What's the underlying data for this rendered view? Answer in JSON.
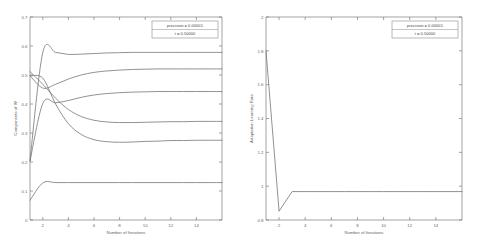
{
  "figure": {
    "background": "#ffffff",
    "line_color": "#6e6e6e",
    "axis_color": "#7d7d7d"
  },
  "chart_data": [
    {
      "type": "line",
      "panel": "left",
      "title": "",
      "xlabel": "Number of Iterations",
      "ylabel": "Components of W",
      "xlim": [
        1,
        16
      ],
      "ylim": [
        0,
        0.7
      ],
      "xticks": [
        2,
        4,
        6,
        8,
        10,
        12,
        14
      ],
      "yticks": [
        0,
        0.1,
        0.2,
        0.3,
        0.4,
        0.5,
        0.6,
        0.7
      ],
      "grid": false,
      "legend_position": "upper right",
      "legend": [
        "precision = 0.00001",
        "t = 0.50000"
      ],
      "x": [
        1,
        2,
        3,
        4,
        5,
        6,
        7,
        8,
        9,
        10,
        11,
        12,
        13,
        14,
        15,
        16
      ],
      "series": [
        {
          "name": "w1",
          "values": [
            0.205,
            0.578,
            0.578,
            0.571,
            0.572,
            0.574,
            0.576,
            0.577,
            0.578,
            0.578,
            0.578,
            0.578,
            0.578,
            0.578,
            0.578,
            0.578
          ]
        },
        {
          "name": "w2",
          "values": [
            0.498,
            0.455,
            0.468,
            0.486,
            0.5,
            0.509,
            0.514,
            0.517,
            0.519,
            0.52,
            0.521,
            0.521,
            0.521,
            0.521,
            0.521,
            0.521
          ]
        },
        {
          "name": "w3",
          "values": [
            0.203,
            0.402,
            0.404,
            0.412,
            0.423,
            0.431,
            0.436,
            0.439,
            0.441,
            0.442,
            0.443,
            0.443,
            0.443,
            0.443,
            0.443,
            0.443
          ]
        },
        {
          "name": "w4",
          "values": [
            0.512,
            0.468,
            0.42,
            0.381,
            0.357,
            0.344,
            0.338,
            0.336,
            0.336,
            0.337,
            0.338,
            0.339,
            0.339,
            0.34,
            0.34,
            0.34
          ]
        },
        {
          "name": "w5",
          "values": [
            0.497,
            0.489,
            0.4,
            0.332,
            0.295,
            0.277,
            0.27,
            0.268,
            0.269,
            0.271,
            0.272,
            0.274,
            0.274,
            0.275,
            0.275,
            0.275
          ]
        },
        {
          "name": "w6",
          "values": [
            0.068,
            0.128,
            0.129,
            0.129,
            0.129,
            0.129,
            0.129,
            0.129,
            0.129,
            0.129,
            0.129,
            0.129,
            0.129,
            0.129,
            0.129,
            0.129
          ]
        }
      ]
    },
    {
      "type": "line",
      "panel": "right",
      "title": "",
      "xlabel": "Number of Iterations",
      "ylabel": "Adaptation Learning Rate",
      "xlim": [
        1,
        16
      ],
      "ylim": [
        0.8,
        2
      ],
      "xticks": [
        2,
        4,
        6,
        8,
        10,
        12,
        14
      ],
      "yticks": [
        0.8,
        1,
        1.2,
        1.4,
        1.6,
        1.8,
        2
      ],
      "grid": false,
      "legend_position": "upper right",
      "legend": [
        "precision = 0.00001",
        "t = 0.50000"
      ],
      "x": [
        1,
        2,
        3,
        4,
        5,
        6,
        7,
        8,
        9,
        10,
        11,
        12,
        13,
        14,
        15,
        16
      ],
      "series": [
        {
          "name": "learning rate",
          "values": [
            1.8,
            0.852,
            0.968,
            0.968,
            0.968,
            0.968,
            0.968,
            0.968,
            0.968,
            0.968,
            0.968,
            0.968,
            0.968,
            0.968,
            0.968,
            0.968
          ]
        }
      ]
    }
  ]
}
